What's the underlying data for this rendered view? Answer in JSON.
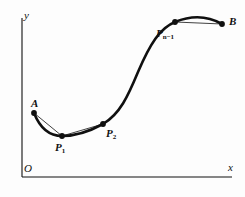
{
  "figure": {
    "type": "bezier-spline-diagram",
    "background_color": "#fdfdfd",
    "ink_color": "#101010",
    "axes": {
      "x_label": "x",
      "y_label": "y",
      "origin_label": "O",
      "x_axis": {
        "x1": 22,
        "y1": 177,
        "x2": 232,
        "y2": 177,
        "stroke_width": 1.1
      },
      "y_axis": {
        "x1": 22,
        "y1": 18,
        "x2": 22,
        "y2": 177,
        "stroke_width": 1.1
      }
    },
    "points": [
      {
        "name": "A",
        "label": "A",
        "subscript": "",
        "x": 34,
        "y": 113,
        "label_x": 31,
        "label_y": 98,
        "radius": 2.9
      },
      {
        "name": "P1",
        "label": "P",
        "subscript": "1",
        "x": 62,
        "y": 136,
        "label_x": 55,
        "label_y": 142,
        "radius": 2.9
      },
      {
        "name": "P2",
        "label": "P",
        "subscript": "2",
        "x": 103,
        "y": 124,
        "label_x": 106,
        "label_y": 128,
        "radius": 2.9
      },
      {
        "name": "Pn-1",
        "label": "P",
        "subscript": "n−1",
        "x": 175,
        "y": 22,
        "label_x": 156,
        "label_y": 28,
        "radius": 2.9
      },
      {
        "name": "B",
        "label": "B",
        "subscript": "",
        "x": 222,
        "y": 24,
        "label_x": 229,
        "label_y": 16,
        "radius": 2.9
      }
    ],
    "curve": {
      "stroke_width": 2.6,
      "path": "M 34 113 C 40 128, 50 136, 62 136 C 76 136, 92 130, 103 124 C 120 114, 128 96, 138 72 C 150 44, 160 28, 175 22 C 192 15, 208 16, 222 24"
    },
    "chords": [
      {
        "name": "chord-A-P1",
        "x1": 34,
        "y1": 113,
        "x2": 62,
        "y2": 136,
        "stroke_width": 0.8
      },
      {
        "name": "chord-P1-P2",
        "x1": 62,
        "y1": 136,
        "x2": 103,
        "y2": 124,
        "stroke_width": 0.8
      },
      {
        "name": "chord-Pn-1-B",
        "x1": 175,
        "y1": 22,
        "x2": 222,
        "y2": 24,
        "stroke_width": 0.8
      }
    ]
  }
}
